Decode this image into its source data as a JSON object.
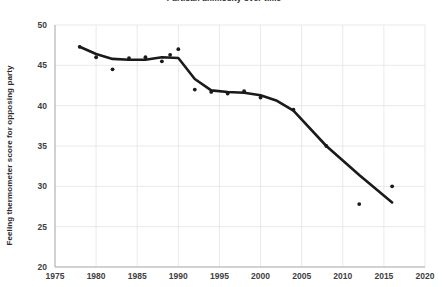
{
  "chart_data": {
    "type": "scatter",
    "title": "Partisan animosity over time",
    "xlabel": "",
    "ylabel": "Feeling thermometer score for opposing party",
    "xlim": [
      1975,
      2020
    ],
    "ylim": [
      20,
      50
    ],
    "xticks": [
      1975,
      1980,
      1985,
      1990,
      1995,
      2000,
      2005,
      2010,
      2015,
      2020
    ],
    "yticks": [
      20,
      25,
      30,
      35,
      40,
      45,
      50
    ],
    "grid": true,
    "legend": "none",
    "point_color": "#1a1a1a",
    "line_color": "#1a1a1a",
    "series": [
      {
        "name": "Feeling thermometer (survey points)",
        "type": "scatter",
        "x": [
          1978,
          1980,
          1982,
          1984,
          1986,
          1988,
          1989,
          1990,
          1992,
          1994,
          1996,
          1998,
          2000,
          2004,
          2008,
          2012,
          2016
        ],
        "values": [
          47.3,
          46.0,
          44.5,
          45.9,
          46.0,
          45.5,
          46.3,
          47.0,
          42.0,
          41.7,
          41.5,
          41.8,
          41.0,
          39.5,
          35.0,
          27.8,
          30.0
        ]
      },
      {
        "name": "Trend line",
        "type": "line",
        "x": [
          1978,
          1980,
          1982,
          1984,
          1986,
          1988,
          1990,
          1992,
          1994,
          1996,
          1998,
          2000,
          2002,
          2004,
          2008,
          2012,
          2016
        ],
        "values": [
          47.3,
          46.4,
          45.8,
          45.7,
          45.7,
          46.0,
          45.9,
          43.3,
          41.9,
          41.7,
          41.6,
          41.3,
          40.6,
          39.4,
          35.0,
          31.4,
          28.0
        ]
      }
    ]
  }
}
